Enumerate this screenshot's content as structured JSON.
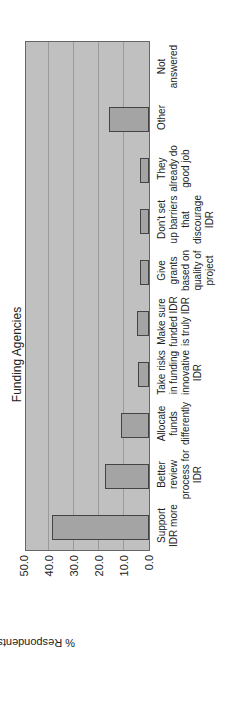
{
  "chart_data": {
    "type": "bar",
    "title": "Funding Agencies",
    "xlabel": "",
    "ylabel": "% Respondents",
    "ylim": [
      0,
      50
    ],
    "yticks": [
      "0.0",
      "10.0",
      "20.0",
      "30.0",
      "40.0",
      "50.0"
    ],
    "grid": true,
    "orientation": "rotated 90° counter-clockwise (vertical bars rendered sideways)",
    "categories": [
      "Support IDR more",
      "Better review process for IDR",
      "Allocate funds differently",
      "Take risks in funding innovative IDR",
      "Make sure funded IDR is truly IDR",
      "Give grants based on quality of project",
      "Don't set up barriers that discourage IDR",
      "They already do good job",
      "Other",
      "Not answered"
    ],
    "values": [
      39.0,
      17.6,
      11.2,
      4.6,
      5.0,
      3.6,
      3.6,
      3.6,
      16.0,
      0.0
    ]
  }
}
